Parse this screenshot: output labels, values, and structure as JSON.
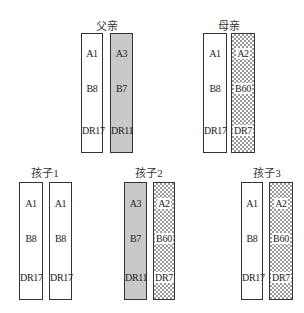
{
  "colors": {
    "border": "#333333",
    "gray_fill": "#c9c9c9",
    "check_fill": "#9a9a9a"
  },
  "groups": [
    {
      "title": "父亲",
      "title_x": 107,
      "title_y": 20,
      "top": 33,
      "bottom": 153,
      "label_y": [
        47,
        82,
        124
      ],
      "chromosomes": [
        {
          "x": 81,
          "w": 22,
          "fill": "white",
          "alleles": [
            "A1",
            "B8",
            "DR17"
          ]
        },
        {
          "x": 110,
          "w": 23,
          "fill": "gray",
          "alleles": [
            "A3",
            "B7",
            "DR11"
          ]
        }
      ]
    },
    {
      "title": "母亲",
      "title_x": 229,
      "title_y": 20,
      "top": 33,
      "bottom": 153,
      "label_y": [
        47,
        82,
        124
      ],
      "chromosomes": [
        {
          "x": 203,
          "w": 24,
          "fill": "white",
          "alleles": [
            "A1",
            "B8",
            "DR17"
          ]
        },
        {
          "x": 231,
          "w": 24,
          "fill": "check",
          "alleles": [
            "A2",
            "B60",
            "DR7"
          ]
        }
      ]
    },
    {
      "title": "孩子1",
      "title_x": 45,
      "title_y": 167,
      "top": 182,
      "bottom": 300,
      "label_y": [
        197,
        232,
        271
      ],
      "chromosomes": [
        {
          "x": 19,
          "w": 24,
          "fill": "white",
          "alleles": [
            "A1",
            "B8",
            "DR17"
          ]
        },
        {
          "x": 49,
          "w": 23,
          "fill": "white",
          "alleles": [
            "A1",
            "B8",
            "DR17"
          ]
        }
      ]
    },
    {
      "title": "孩子2",
      "title_x": 149,
      "title_y": 167,
      "top": 182,
      "bottom": 300,
      "label_y": [
        197,
        232,
        271
      ],
      "chromosomes": [
        {
          "x": 124,
          "w": 23,
          "fill": "gray",
          "alleles": [
            "A3",
            "B7",
            "DR11"
          ]
        },
        {
          "x": 153,
          "w": 22,
          "fill": "check",
          "alleles": [
            "A2",
            "B60",
            "DR7"
          ]
        }
      ]
    },
    {
      "title": "孩子3",
      "title_x": 267,
      "title_y": 167,
      "top": 182,
      "bottom": 300,
      "label_y": [
        197,
        232,
        271
      ],
      "chromosomes": [
        {
          "x": 241,
          "w": 22,
          "fill": "white",
          "alleles": [
            "A1",
            "B8",
            "DR17"
          ]
        },
        {
          "x": 269,
          "w": 24,
          "fill": "check",
          "alleles": [
            "A2",
            "B60",
            "DR7"
          ]
        }
      ]
    }
  ]
}
